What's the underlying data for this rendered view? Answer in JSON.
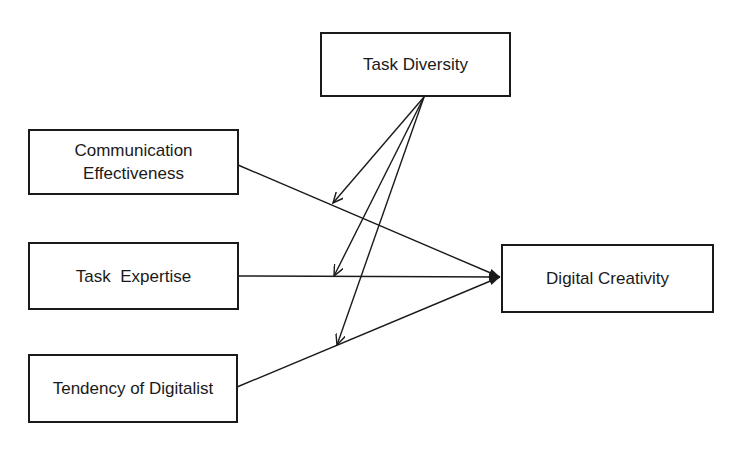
{
  "diagram": {
    "nodes": [
      {
        "id": "task_diversity",
        "label": "Task Diversity",
        "role": "moderator"
      },
      {
        "id": "communication_effectiveness",
        "label": "Communication\nEffectiveness",
        "role": "independent"
      },
      {
        "id": "task_expertise",
        "label": "Task  Expertise",
        "role": "independent"
      },
      {
        "id": "tendency_of_digitalist",
        "label": "Tendency of Digitalist",
        "role": "independent"
      },
      {
        "id": "digital_creativity",
        "label": "Digital Creativity",
        "role": "dependent"
      }
    ],
    "edges": [
      {
        "from": "communication_effectiveness",
        "to": "digital_creativity",
        "type": "direct"
      },
      {
        "from": "task_expertise",
        "to": "digital_creativity",
        "type": "direct"
      },
      {
        "from": "tendency_of_digitalist",
        "to": "digital_creativity",
        "type": "direct"
      },
      {
        "from": "task_diversity",
        "to": "communication_effectiveness->digital_creativity",
        "type": "moderation"
      },
      {
        "from": "task_diversity",
        "to": "task_expertise->digital_creativity",
        "type": "moderation"
      },
      {
        "from": "task_diversity",
        "to": "tendency_of_digitalist->digital_creativity",
        "type": "moderation"
      }
    ],
    "colors": {
      "line": "#1a1a1a",
      "background": "#ffffff"
    }
  }
}
